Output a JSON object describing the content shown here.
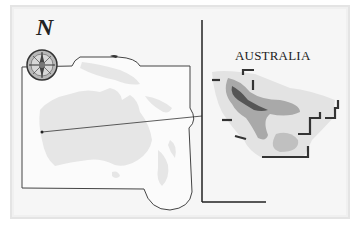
{
  "figure": {
    "compass_label": "N",
    "inset_title": "AUSTRALIA",
    "colors": {
      "card_background": "#f6f6f6",
      "landmass": "#e6e6e6",
      "ocean_halo": "#fbfbfb",
      "rainfall_light": "#d4d4d4",
      "rainfall_medium": "#a9a9a9",
      "rainfall_dark": "#555555",
      "lines": "#333333"
    },
    "elements": [
      "compass-rose",
      "regional-map-frame",
      "pointer-line",
      "australia-inset-map",
      "inset-axes-frame"
    ]
  }
}
